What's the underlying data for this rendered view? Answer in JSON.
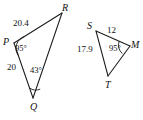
{
  "figure": {
    "stroke_color": "#1c1c1c",
    "text_color": "#111111",
    "background_color": "#ffffff",
    "triangles": [
      {
        "name": "triangle-pqr",
        "vertices": [
          {
            "label": "P",
            "x": 14,
            "y": 43
          },
          {
            "label": "Q",
            "x": 33,
            "y": 98
          },
          {
            "label": "R",
            "x": 62,
            "y": 13
          }
        ],
        "side_labels": [
          {
            "name": "side-pr",
            "text": "20.4"
          },
          {
            "name": "side-pq",
            "text": "20"
          }
        ],
        "angle_labels": [
          {
            "name": "angle-p",
            "text": "95°",
            "vertex": "P"
          },
          {
            "name": "angle-q",
            "text": "43°",
            "vertex": "Q"
          }
        ]
      },
      {
        "name": "triangle-smt",
        "vertices": [
          {
            "label": "S",
            "x": 96,
            "y": 31
          },
          {
            "label": "M",
            "x": 130,
            "y": 46
          },
          {
            "label": "T",
            "x": 108,
            "y": 76
          }
        ],
        "side_labels": [
          {
            "name": "side-sm",
            "text": "12"
          },
          {
            "name": "side-st",
            "text": "17.9"
          }
        ],
        "angle_labels": [
          {
            "name": "angle-m",
            "text": "95°",
            "vertex": "M"
          }
        ]
      }
    ]
  },
  "labels": {
    "p_vertex": "P",
    "q_vertex": "Q",
    "r_vertex": "R",
    "s_vertex": "S",
    "m_vertex": "M",
    "t_vertex": "T",
    "pr_length": "20.4",
    "pq_length": "20",
    "angle_p": "95°",
    "angle_q": "43°",
    "sm_length": "12",
    "st_length": "17.9",
    "angle_m": "95°"
  }
}
